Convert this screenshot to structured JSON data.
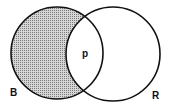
{
  "diagram": {
    "type": "venn",
    "sets": [
      {
        "label": "B",
        "shaded": true
      },
      {
        "label": "R",
        "shaded": false
      }
    ],
    "intersection_label": "p",
    "shade_color": "#bdbdbd",
    "stroke_color": "#111111"
  }
}
